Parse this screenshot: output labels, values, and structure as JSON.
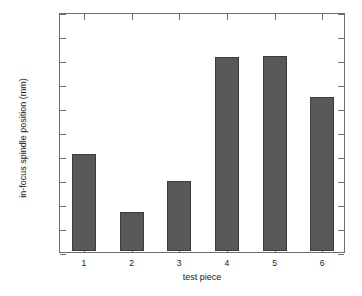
{
  "chart_data": {
    "type": "bar",
    "title": "",
    "xlabel": "test piece",
    "ylabel": "in-focus spindle position (mm)",
    "categories": [
      "1",
      "2",
      "3",
      "4",
      "5",
      "6"
    ],
    "values": [
      96.202,
      96.081,
      96.145,
      96.405,
      96.407,
      96.321
    ],
    "ylim": [
      96,
      96.5
    ],
    "yticks": [
      "96",
      "96.05",
      "96.1",
      "96.15",
      "96.2",
      "96.25",
      "96.3",
      "96.35",
      "96.4",
      "96.45",
      "96.5"
    ],
    "ytick_values": [
      96,
      96.05,
      96.1,
      96.15,
      96.2,
      96.25,
      96.3,
      96.35,
      96.4,
      96.45,
      96.5
    ],
    "xticks": [
      "1",
      "2",
      "3",
      "4",
      "5",
      "6"
    ],
    "grid": false,
    "legend": null,
    "bar_color": "#585858",
    "bar_edge_color": "#3d3d3d",
    "axes_color": "#6e6e6e",
    "background_color": "#ffffff"
  }
}
